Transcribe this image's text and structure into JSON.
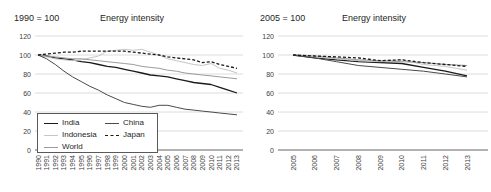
{
  "colors": {
    "background": "#ffffff",
    "gridline": "#dcdcdc",
    "axis_line": "#666666",
    "tick_label": "#404040",
    "title_text": "#262626",
    "legend_border": "#595959"
  },
  "chart_data": [
    {
      "type": "line",
      "subtitle": "1990 = 100",
      "title": "Energy intensity",
      "xlabel": "",
      "ylabel": "",
      "x": [
        1990,
        1991,
        1992,
        1993,
        1994,
        1995,
        1996,
        1997,
        1998,
        1999,
        2000,
        2001,
        2002,
        2003,
        2004,
        2005,
        2006,
        2007,
        2008,
        2009,
        2010,
        2011,
        2012,
        2013
      ],
      "ylim": [
        0,
        120
      ],
      "yticks": [
        0,
        20,
        40,
        60,
        80,
        100,
        120
      ],
      "grid": true,
      "legend_position": "inside-bottom-left",
      "series": [
        {
          "name": "India",
          "color": "#1a1a1a",
          "dash": "solid",
          "values": [
            100,
            99,
            97,
            96,
            95,
            93,
            92,
            90,
            88,
            87,
            85,
            83,
            81,
            79,
            78,
            77,
            75,
            73,
            71,
            70,
            69,
            66,
            63,
            60
          ]
        },
        {
          "name": "Indonesia",
          "color": "#c6c6c6",
          "dash": "solid",
          "values": [
            100,
            98,
            96,
            95,
            94,
            95,
            97,
            99,
            104,
            105,
            106,
            105,
            106,
            103,
            100,
            96,
            94,
            92,
            90,
            89,
            91,
            86,
            84,
            81
          ]
        },
        {
          "name": "World",
          "color": "#9b9b9b",
          "dash": "solid",
          "values": [
            100,
            99,
            98,
            97,
            96,
            96,
            95,
            94,
            93,
            92,
            91,
            90,
            88,
            87,
            86,
            84,
            83,
            81,
            80,
            79,
            78,
            77,
            76,
            75
          ]
        },
        {
          "name": "China",
          "color": "#4a4a4a",
          "dash": "solid",
          "values": [
            100,
            96,
            90,
            83,
            77,
            72,
            67,
            63,
            58,
            54,
            50,
            48,
            46,
            45,
            47,
            47,
            45,
            43,
            42,
            41,
            40,
            39,
            38,
            37
          ]
        },
        {
          "name": "Japan",
          "color": "#1a1a1a",
          "dash": "dashed",
          "values": [
            100,
            101,
            102,
            103,
            103,
            104,
            104,
            104,
            104,
            104,
            104,
            103,
            102,
            101,
            100,
            98,
            97,
            96,
            95,
            92,
            93,
            90,
            88,
            86
          ]
        }
      ]
    },
    {
      "type": "line",
      "subtitle": "2005 = 100",
      "title": "Energy intensity",
      "xlabel": "",
      "ylabel": "",
      "x": [
        2005,
        2006,
        2007,
        2008,
        2009,
        2010,
        2011,
        2012,
        2013
      ],
      "ylim": [
        0,
        120
      ],
      "yticks": [
        0,
        20,
        40,
        60,
        80,
        100,
        120
      ],
      "grid": true,
      "legend_position": "none",
      "series": [
        {
          "name": "India",
          "color": "#1a1a1a",
          "dash": "solid",
          "values": [
            100,
            97,
            95,
            93,
            92,
            91,
            87,
            83,
            78
          ]
        },
        {
          "name": "Indonesia",
          "color": "#c6c6c6",
          "dash": "solid",
          "values": [
            100,
            98,
            96,
            94,
            93,
            95,
            90,
            88,
            84
          ]
        },
        {
          "name": "World",
          "color": "#9b9b9b",
          "dash": "solid",
          "values": [
            100,
            99,
            97,
            95,
            94,
            93,
            92,
            90,
            89
          ]
        },
        {
          "name": "China",
          "color": "#4a4a4a",
          "dash": "solid",
          "values": [
            100,
            97,
            93,
            89,
            87,
            85,
            83,
            80,
            77
          ]
        },
        {
          "name": "Japan",
          "color": "#1a1a1a",
          "dash": "dashed",
          "values": [
            100,
            99,
            98,
            97,
            94,
            95,
            92,
            90,
            88
          ]
        }
      ]
    }
  ]
}
